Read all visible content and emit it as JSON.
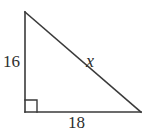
{
  "figure": {
    "type": "right-triangle-diagram",
    "stroke_color": "#3a3a3a",
    "background_color": "#ffffff",
    "text_color": "#2e2e2e",
    "labels": {
      "vertical_leg": "16",
      "horizontal_leg": "18",
      "hypotenuse": "x"
    },
    "geometry": {
      "apex": [
        25,
        12
      ],
      "right_angle_vertex": [
        25,
        112
      ],
      "right_vertex": [
        141,
        112
      ],
      "right_angle_marker_size": 12
    }
  }
}
